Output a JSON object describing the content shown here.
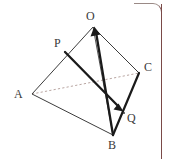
{
  "figure": {
    "type": "geometry-diagram",
    "canvas": {
      "width": 169,
      "height": 159,
      "background": "#ffffff"
    },
    "styles": {
      "edge_color": "#3c3c3c",
      "thick_vector_color": "#1a1a1a",
      "hidden_edge_color": "#b9a6a2",
      "label_color": "#3a3a3a",
      "border_color": "#7a4a48",
      "edge_width": 1,
      "vector_width": 2.4
    },
    "points": [
      {
        "id": "O",
        "label": "O",
        "x": 93,
        "y": 27,
        "label_x": 86,
        "label_y": 10
      },
      {
        "id": "P",
        "label": "P",
        "x": 65,
        "y": 52,
        "label_x": 54,
        "label_y": 37
      },
      {
        "id": "C",
        "label": "C",
        "x": 139,
        "y": 73,
        "label_x": 144,
        "label_y": 61
      },
      {
        "id": "A",
        "label": "A",
        "x": 32,
        "y": 94,
        "label_x": 14,
        "label_y": 88
      },
      {
        "id": "Q",
        "label": "Q",
        "x": 124,
        "y": 113,
        "label_x": 127,
        "label_y": 112
      },
      {
        "id": "B",
        "label": "B",
        "x": 113,
        "y": 135,
        "label_x": 108,
        "label_y": 139
      }
    ],
    "edges": [
      {
        "id": "AO",
        "from": "A",
        "to": "O",
        "style": "solid",
        "kind": "edge"
      },
      {
        "id": "AB",
        "from": "A",
        "to": "B",
        "style": "solid",
        "kind": "edge"
      },
      {
        "id": "AC",
        "from": "A",
        "to": "C",
        "style": "dashed",
        "kind": "hidden-edge"
      },
      {
        "id": "OC",
        "from": "O",
        "to": "C",
        "style": "solid",
        "kind": "edge"
      },
      {
        "id": "BC",
        "from": "B",
        "to": "C",
        "style": "solid",
        "kind": "edge"
      },
      {
        "id": "OB",
        "from": "O",
        "to": "B",
        "style": "solid",
        "kind": "edge"
      }
    ],
    "vectors": [
      {
        "id": "PQ",
        "from": "P",
        "to": "Q",
        "arrow": "end",
        "label": "PQ"
      },
      {
        "id": "BO",
        "from": "B",
        "to": "O",
        "arrow": "end",
        "label": "BO"
      }
    ]
  },
  "border": {
    "visible": true,
    "sides": "top-right rounded corner and right vertical rule",
    "color": "#7a4a48"
  }
}
